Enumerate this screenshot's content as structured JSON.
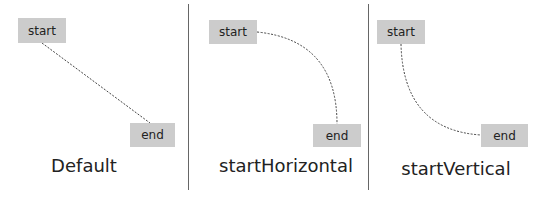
{
  "panels": [
    {
      "caption": "Default",
      "start_label": "start",
      "end_label": "end",
      "connector": "straight"
    },
    {
      "caption": "startHorizontal",
      "start_label": "start",
      "end_label": "end",
      "connector": "curve-horizontal-start"
    },
    {
      "caption": "startVertical",
      "start_label": "start",
      "end_label": "end",
      "connector": "curve-vertical-start"
    }
  ],
  "colors": {
    "box": "#cccccc",
    "line": "#444444",
    "divider": "#666666"
  }
}
